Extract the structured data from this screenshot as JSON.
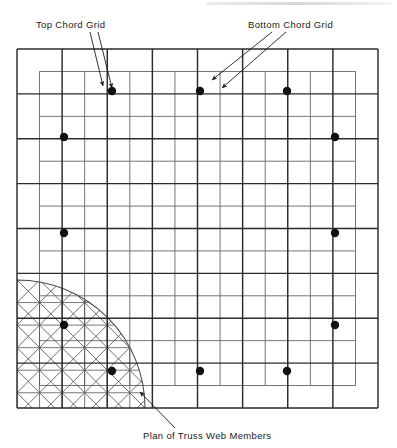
{
  "figure": {
    "caption_bottom": "Plan of Truss Web Members",
    "label_top_chord": "Top Chord Grid",
    "label_bottom_chord": "Bottom Chord Grid"
  },
  "chart_data": {
    "type": "diagram",
    "title": "Plan of Truss Web Members",
    "annotations": [
      {
        "text": "Top Chord Grid",
        "x": 36,
        "y": 19,
        "leader_from": [
          98,
          32
        ],
        "leader_to": [
          112,
          88
        ]
      },
      {
        "text": "Bottom Chord Grid",
        "x": 248,
        "y": 19,
        "leader_from": [
          286,
          32
        ],
        "leader_to": [
          222,
          88
        ]
      },
      {
        "text": "Plan of Truss Web Members",
        "x": 143,
        "y": 430,
        "leader_from": [
          175,
          428
        ],
        "leader_to": [
          140,
          392
        ]
      }
    ],
    "grids": [
      {
        "name": "top-chord-grid",
        "style": "bold",
        "x0": 17,
        "y0": 49,
        "x1": 378,
        "y1": 408,
        "divisions_x": 8,
        "divisions_y": 8,
        "spacing": 45.1,
        "description": "Outer heavy grid, 8 x 8 bays"
      },
      {
        "name": "bottom-chord-grid",
        "style": "thin-offset",
        "x0": 39.5,
        "y0": 71.5,
        "x1": 355.5,
        "y1": 385.5,
        "divisions_x": 7,
        "divisions_y": 7,
        "spacing": 45.1,
        "offset": 22.55,
        "description": "Inset light grid offset half a bay from top chord"
      }
    ],
    "nodes": {
      "name": "column-support-points",
      "marker": "filled-circle",
      "radius": 4.2,
      "points": [
        {
          "x": 112,
          "y": 91
        },
        {
          "x": 200,
          "y": 91
        },
        {
          "x": 287,
          "y": 91
        },
        {
          "x": 64,
          "y": 137
        },
        {
          "x": 335,
          "y": 137
        },
        {
          "x": 64,
          "y": 233
        },
        {
          "x": 335,
          "y": 233
        },
        {
          "x": 64,
          "y": 325
        },
        {
          "x": 335,
          "y": 325
        },
        {
          "x": 112,
          "y": 371
        },
        {
          "x": 200,
          "y": 371
        },
        {
          "x": 287,
          "y": 371
        }
      ]
    },
    "web_member_zone": {
      "name": "quarter-circle-web-member-zone",
      "shape": "quarter-circle",
      "center": [
        17,
        408
      ],
      "radius": 128,
      "contents": "diagonal web members forming X-bracing in each bay"
    },
    "colors": {
      "grid_bold": "#2b2b2b",
      "grid_thin": "#6e6e72",
      "web_member": "#55555a",
      "arc": "#4a4a4f",
      "node": "#111111",
      "text": "#1a1a1a",
      "background": "#ffffff"
    }
  }
}
